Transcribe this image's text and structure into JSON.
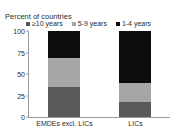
{
  "top_remnant": "",
  "chart_data": {
    "type": "bar",
    "subtype": "stacked-vertical-100",
    "title": "",
    "ylabel": "Percent of countries",
    "xlabel": "",
    "categories": [
      "EMDEs excl. LICs",
      "LICs"
    ],
    "ylim": [
      0,
      100
    ],
    "yticks": [
      "0",
      "25",
      "50",
      "75",
      "100"
    ],
    "ytick_values": [
      0,
      25,
      50,
      75,
      100
    ],
    "grid": false,
    "legend_position": "top",
    "series": [
      {
        "name": "≥10 years",
        "color": "#595959",
        "values": [
          35,
          17
        ]
      },
      {
        "name": "5-9 years",
        "color": "#a6a6a6",
        "values": [
          34,
          23
        ]
      },
      {
        "name": "1-4 years",
        "color": "#0d0d0d",
        "values": [
          31,
          60
        ]
      }
    ]
  }
}
